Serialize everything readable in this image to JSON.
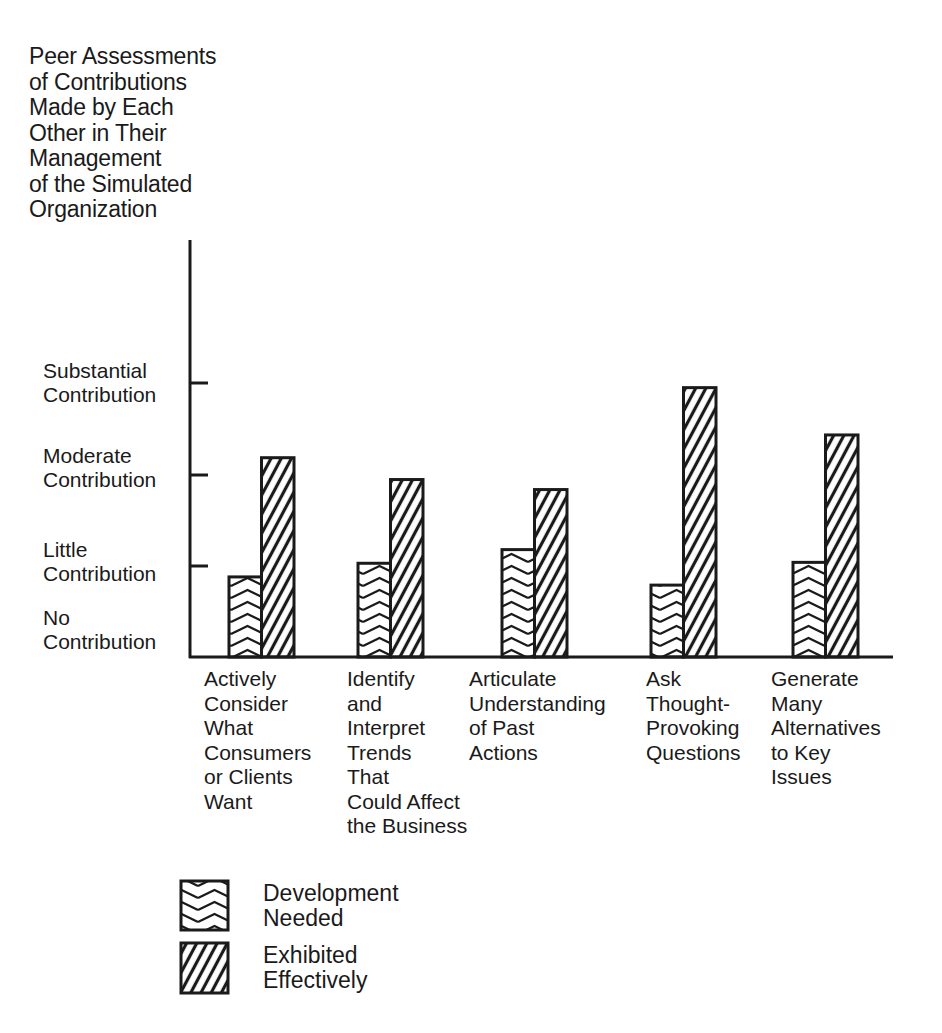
{
  "chart_data": {
    "type": "bar",
    "title": "",
    "ylabel": "Peer Assessments\nof Contributions\nMade by Each\nOther in Their\nManagement\nof the Simulated\nOrganization",
    "xlabel": "",
    "y_ticks": [
      {
        "value": 0,
        "label": "No\nContribution"
      },
      {
        "value": 1,
        "label": "Little\nContribution"
      },
      {
        "value": 2,
        "label": "Moderate\nContribution"
      },
      {
        "value": 3,
        "label": "Substantial\nContribution"
      }
    ],
    "ylim": [
      0,
      4.6
    ],
    "categories": [
      "Actively\nConsider\nWhat\nConsumers\nor Clients\nWant",
      "Identify\nand\nInterpret\nTrends\nThat\nCould Affect\nthe Business",
      "Articulate\nUnderstanding\nof Past\nActions",
      "Ask\nThought-\nProvoking\nQuestions",
      "Generate\nMany\nAlternatives\nto Key\nIssues"
    ],
    "series": [
      {
        "name": "Development Needed",
        "pattern": "chevron",
        "values": [
          0.88,
          1.03,
          1.18,
          0.79,
          1.04
        ]
      },
      {
        "name": "Exhibited Effectively",
        "pattern": "diagonal",
        "values": [
          2.19,
          1.95,
          1.84,
          2.96,
          2.44
        ]
      }
    ],
    "grid": false,
    "legend_position": "bottom-left"
  },
  "legend": {
    "items": [
      {
        "label": "Development\nNeeded"
      },
      {
        "label": "Exhibited\nEffectively"
      }
    ]
  },
  "colors": {
    "ink": "#1a1a1a",
    "background": "#ffffff"
  }
}
